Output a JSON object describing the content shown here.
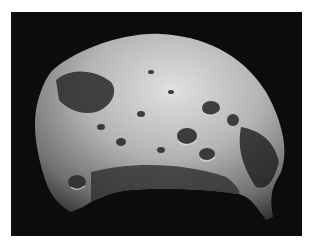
{
  "image": {
    "subject": "cratered moon (grayscale space photograph)",
    "background_color": "#ffffff",
    "space_color": "#0c0c0c",
    "surface_light": "#d8d8d8",
    "surface_mid": "#9a9a9a",
    "surface_dark": "#3a3a3a"
  }
}
